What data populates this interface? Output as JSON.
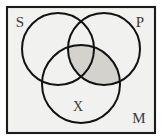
{
  "figure": {
    "name": "three-circle-venn-syllogism",
    "background_color": "#ffffff",
    "frame": {
      "fill_color": "#f1f1ef",
      "stroke_color": "#1b1b1b",
      "x": 7,
      "y": 7,
      "width": 148,
      "height": 126
    }
  },
  "circles": [
    {
      "id": "S",
      "label": "S",
      "cx": 58,
      "cy": 49,
      "r": 36,
      "stroke_color": "#121212"
    },
    {
      "id": "P",
      "label": "P",
      "cx": 104,
      "cy": 49,
      "r": 36,
      "stroke_color": "#121212"
    },
    {
      "id": "M",
      "label": "M",
      "cx": 81,
      "cy": 84,
      "r": 39,
      "stroke_color": "#121212"
    }
  ],
  "labels": [
    {
      "name": "label-s",
      "text": "S",
      "x": 20,
      "y": 24
    },
    {
      "name": "label-p",
      "text": "P",
      "x": 140,
      "y": 24
    },
    {
      "name": "label-m",
      "text": "M",
      "x": 139,
      "y": 120
    },
    {
      "name": "label-x",
      "text": "X",
      "x": 78,
      "y": 108
    }
  ],
  "shading": {
    "name": "p-intersect-m-shaded",
    "description": "lens region where circle P overlaps circle M",
    "fill_color": "#d4d2cd"
  },
  "colors": {
    "paper": "#f1f1ef",
    "ink": "#121212",
    "label_ink": "#3a3a3a",
    "shade": "#d4d2cd",
    "page": "#ffffff"
  }
}
